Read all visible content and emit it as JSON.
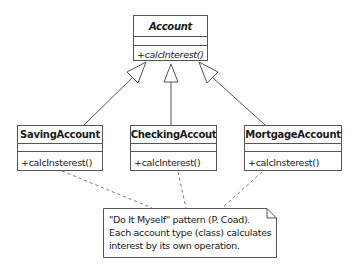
{
  "diagram": {
    "type": "UML class diagram",
    "classes": [
      {
        "id": "account",
        "name": "Account",
        "abstract": true,
        "attributes": [],
        "operations": [
          "+calcInterest()"
        ]
      },
      {
        "id": "saving",
        "name": "SavingAccount",
        "abstract": false,
        "attributes": [],
        "operations": [
          "+calcInsterest()"
        ]
      },
      {
        "id": "checking",
        "name": "CheckingAccout",
        "abstract": false,
        "attributes": [],
        "operations": [
          "+calcInterest()"
        ]
      },
      {
        "id": "mortgage",
        "name": "MortgageAccount",
        "abstract": false,
        "attributes": [],
        "operations": [
          "+calcInsterest()"
        ]
      }
    ],
    "relations": [
      {
        "type": "generalization",
        "from": "SavingAccount",
        "to": "Account"
      },
      {
        "type": "generalization",
        "from": "CheckingAccout",
        "to": "Account"
      },
      {
        "type": "generalization",
        "from": "MortgageAccount",
        "to": "Account"
      },
      {
        "type": "note-anchor",
        "from": "SavingAccount",
        "to": "note"
      },
      {
        "type": "note-anchor",
        "from": "CheckingAccout",
        "to": "note"
      },
      {
        "type": "note-anchor",
        "from": "MortgageAccount",
        "to": "note"
      }
    ],
    "note": {
      "lines": [
        "\"Do It Myself\" pattern (P. Coad).",
        "Each account type (class) calculates",
        "interest by its own operation."
      ]
    },
    "colors": {
      "line": "#555555",
      "background": "#ffffff",
      "text": "#1a1a1a"
    }
  }
}
